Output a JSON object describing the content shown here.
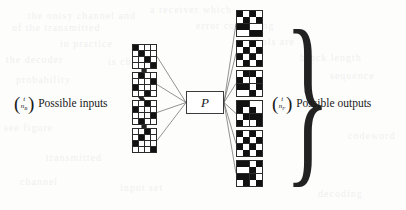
{
  "figure": {
    "type": "channel-diagram",
    "background_color": "#fdfdfc",
    "ink_color": "#111111"
  },
  "input_side": {
    "label_text": "Possible inputs",
    "binomial": {
      "top": "t",
      "bottom": "n",
      "bottom_sub": "B",
      "full": "(t choose n_B)"
    },
    "brace": "{",
    "count": 4
  },
  "output_side": {
    "label_text": "Possible outputs",
    "binomial": {
      "top": "t",
      "bottom": "n",
      "bottom_sub": "F",
      "full": "(t choose n_F)"
    },
    "brace": "}",
    "count": 6
  },
  "channel": {
    "label": "P",
    "box_stroke": "#3c3c3c"
  },
  "grids": {
    "rows": 4,
    "cols": 4,
    "on_color": "#111111",
    "off_color": "#ffffff",
    "line_color": "#2a2a2a",
    "inputs": [
      [
        1,
        0,
        0,
        0,
        0,
        1,
        0,
        0,
        0,
        0,
        1,
        0,
        0,
        0,
        0,
        1
      ],
      [
        0,
        1,
        0,
        0,
        0,
        0,
        0,
        1,
        1,
        0,
        0,
        0,
        0,
        0,
        1,
        0
      ],
      [
        0,
        0,
        1,
        0,
        1,
        0,
        0,
        0,
        0,
        0,
        0,
        1,
        0,
        1,
        0,
        0
      ],
      [
        0,
        0,
        1,
        0,
        0,
        1,
        0,
        0,
        1,
        0,
        0,
        0,
        0,
        0,
        0,
        1
      ]
    ],
    "outputs": [
      [
        1,
        0,
        1,
        0,
        0,
        1,
        0,
        1,
        1,
        1,
        0,
        0,
        0,
        0,
        1,
        1
      ],
      [
        1,
        0,
        1,
        0,
        0,
        1,
        0,
        1,
        1,
        0,
        1,
        0,
        0,
        1,
        0,
        1
      ],
      [
        0,
        1,
        1,
        0,
        1,
        0,
        0,
        1,
        1,
        1,
        0,
        1,
        0,
        0,
        1,
        0
      ],
      [
        1,
        1,
        0,
        0,
        1,
        0,
        1,
        0,
        0,
        1,
        1,
        1,
        1,
        0,
        0,
        1
      ],
      [
        1,
        0,
        1,
        0,
        0,
        1,
        0,
        1,
        1,
        0,
        1,
        0,
        0,
        1,
        0,
        1
      ],
      [
        1,
        1,
        0,
        1,
        0,
        0,
        1,
        0,
        1,
        1,
        1,
        0,
        0,
        1,
        0,
        1
      ]
    ]
  },
  "bleed_through": [
    {
      "text": "the noisy channel and",
      "x": 28,
      "y": 10
    },
    {
      "text": "a receiver which",
      "x": 150,
      "y": 4
    },
    {
      "text": "of the transmitted",
      "x": 12,
      "y": 22
    },
    {
      "text": "error correcting",
      "x": 196,
      "y": 20
    },
    {
      "text": "in practice",
      "x": 60,
      "y": 38
    },
    {
      "text": "symbols are",
      "x": 236,
      "y": 36
    },
    {
      "text": "the decoder",
      "x": 6,
      "y": 54
    },
    {
      "text": "is chosen",
      "x": 108,
      "y": 56
    },
    {
      "text": "block length",
      "x": 300,
      "y": 52
    },
    {
      "text": "probability",
      "x": 16,
      "y": 74
    },
    {
      "text": "sequence",
      "x": 330,
      "y": 70
    },
    {
      "text": "see figure",
      "x": 4,
      "y": 122
    },
    {
      "text": "transmitted",
      "x": 46,
      "y": 152
    },
    {
      "text": "codeword",
      "x": 348,
      "y": 130
    },
    {
      "text": "channel",
      "x": 20,
      "y": 176
    },
    {
      "text": "input set",
      "x": 120,
      "y": 182
    },
    {
      "text": "decoding",
      "x": 318,
      "y": 188
    }
  ]
}
